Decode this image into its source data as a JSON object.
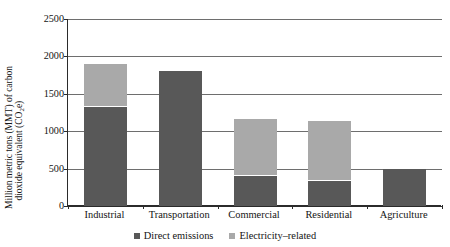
{
  "chart_data": {
    "type": "bar",
    "subtype": "stacked-vertical",
    "title": "",
    "xlabel": "",
    "ylabel": "Million metric tons (MMT) of carbon dioxide equivalent (CO2e)",
    "ylabel_line1": "Million metric tons (MMT) of carbon",
    "ylabel_line2_pre": "dioxide equivalent (CO",
    "ylabel_line2_sub": "2",
    "ylabel_line2_post": "e)",
    "categories": [
      "Industrial",
      "Transportation",
      "Commercial",
      "Residential",
      "Agriculture"
    ],
    "series": [
      {
        "name": "Direct emissions",
        "color": "#585858",
        "values": [
          1320,
          1810,
          400,
          340,
          490
        ]
      },
      {
        "name": "Electricity-related",
        "color": "#a9a9a9",
        "values": [
          580,
          0,
          770,
          800,
          0
        ]
      }
    ],
    "totals": [
      1900,
      1810,
      1170,
      1140,
      490
    ],
    "ylim": [
      0,
      2500
    ],
    "yticks": [
      0,
      500,
      1000,
      1500,
      2000,
      2500
    ],
    "ytick_labels": [
      "0",
      "500",
      "1000",
      "1500",
      "2000",
      "2500"
    ],
    "grid": "horizontal",
    "legend_position": "bottom-center",
    "legend": [
      "Direct emissions",
      "Electricity–related"
    ]
  },
  "legend": {
    "items": [
      {
        "label": "Direct emissions",
        "color": "#585858",
        "icon": "square-marker-icon"
      },
      {
        "label": "Electricity–related",
        "color": "#a9a9a9",
        "icon": "square-marker-icon"
      }
    ]
  },
  "colors": {
    "direct": "#585858",
    "electricity": "#a9a9a9",
    "axis": "#2b2b2b",
    "grid": "#6e6e6e",
    "text": "#141414",
    "background": "#ffffff"
  }
}
